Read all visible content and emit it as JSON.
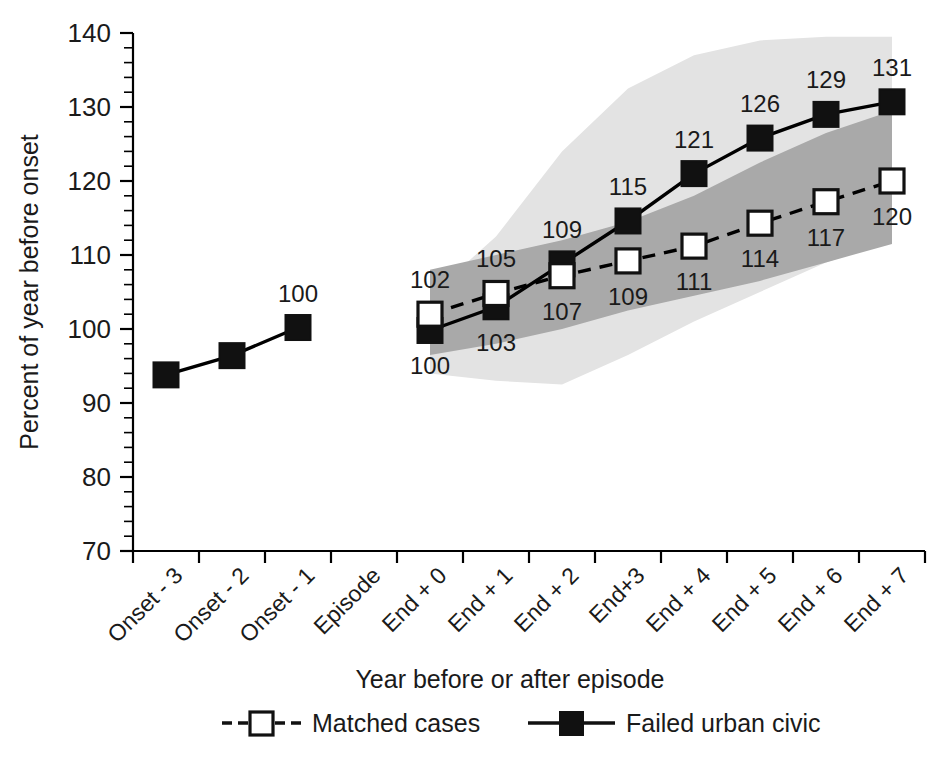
{
  "chart_data": {
    "type": "line",
    "title": "",
    "xlabel": "Year before or after episode",
    "ylabel": "Percent of year before onset",
    "ylim": [
      70,
      140
    ],
    "y_major_step": 10,
    "y_minor_step": 2,
    "grid": false,
    "legend_position": "bottom",
    "categories": [
      "Onset - 3",
      "Onset - 2",
      "Onset - 1",
      "Episode",
      "End + 0",
      "End + 1",
      "End + 2",
      "End+3",
      "End + 4",
      "End + 5",
      "End + 6",
      "End + 7"
    ],
    "series": [
      {
        "name": "Failed urban civic",
        "marker": "filled-square",
        "line": "solid",
        "color": "#111111",
        "values": [
          93.8,
          96.4,
          100.2,
          null,
          99.8,
          103.0,
          108.8,
          114.6,
          121.0,
          125.8,
          129.0,
          130.7
        ],
        "labels": [
          null,
          null,
          "100",
          null,
          "100",
          "103",
          "109",
          "115",
          "121",
          "126",
          "129",
          "131"
        ],
        "label_positions": [
          null,
          null,
          "above",
          null,
          "below",
          "below",
          "above",
          "above",
          "above",
          "above",
          "above",
          "above"
        ]
      },
      {
        "name": "Matched cases",
        "marker": "open-square",
        "line": "dashed",
        "color": "#111111",
        "values": [
          null,
          null,
          null,
          null,
          102.0,
          104.8,
          107.2,
          109.2,
          111.2,
          114.3,
          117.2,
          120.0
        ],
        "labels": [
          null,
          null,
          null,
          null,
          "102",
          "105",
          "107",
          "109",
          "111",
          "114",
          "117",
          "120"
        ],
        "label_positions": [
          null,
          null,
          null,
          null,
          "above",
          "above",
          "below",
          "below",
          "below",
          "below",
          "below",
          "below"
        ]
      }
    ],
    "bands": [
      {
        "name": "Failed urban civic confidence band",
        "color": "#e3e3e3",
        "start_category": "End + 0",
        "upper": [
          104.5,
          112.5,
          124.0,
          132.5,
          137.0,
          139.0,
          139.5,
          139.5
        ],
        "lower": [
          94.0,
          93.0,
          92.5,
          96.5,
          101.0,
          105.0,
          109.0,
          112.0
        ]
      },
      {
        "name": "Matched cases confidence band",
        "color": "#a9a9a9",
        "start_category": "End + 0",
        "upper": [
          108.0,
          110.0,
          112.0,
          114.5,
          118.0,
          122.5,
          126.5,
          129.5
        ],
        "lower": [
          96.5,
          98.0,
          100.0,
          102.5,
          104.5,
          106.5,
          109.0,
          111.5
        ]
      }
    ],
    "y_tick_labels": [
      "140",
      "130",
      "120",
      "110",
      "100",
      "90",
      "80",
      "70"
    ],
    "y_tick_values": [
      140,
      130,
      120,
      110,
      100,
      90,
      80,
      70
    ]
  },
  "legend": {
    "items": [
      {
        "label": "Matched cases",
        "style": "dashed-open-square"
      },
      {
        "label": "Failed urban civic",
        "style": "solid-filled-square"
      }
    ]
  }
}
